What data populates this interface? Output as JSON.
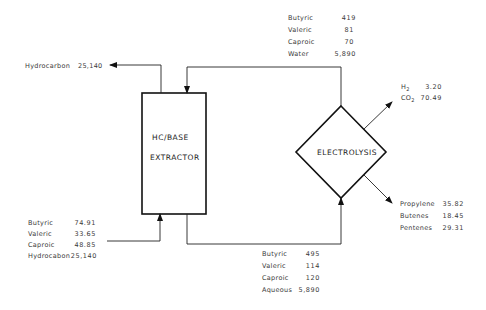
{
  "nodes": {
    "extractor": {
      "line1": "HC/BASE",
      "line2": "EXTRACTOR"
    },
    "electrolysis": {
      "label": "ELECTROLYSIS"
    }
  },
  "streams": {
    "hydrocarbon_out": {
      "label": "Hydrocarbon",
      "value": "25,140"
    },
    "recycle": [
      {
        "label": "Butyric",
        "value": "419"
      },
      {
        "label": "Valeric",
        "value": "81"
      },
      {
        "label": "Caproic",
        "value": "70"
      },
      {
        "label": "Water",
        "value": "5,890"
      }
    ],
    "gases": [
      {
        "label": "H",
        "sub": "2",
        "value": "3.20"
      },
      {
        "label": "CO",
        "sub": "2",
        "value": "70.49"
      }
    ],
    "olefins": [
      {
        "label": "Propylene",
        "value": "35.82"
      },
      {
        "label": "Butenes",
        "value": "18.45"
      },
      {
        "label": "Pentenes",
        "value": "29.31"
      }
    ],
    "feed": [
      {
        "label": "Butyric",
        "value": "74.91"
      },
      {
        "label": "Valeric",
        "value": "33.65"
      },
      {
        "label": "Caproic",
        "value": "48.85"
      },
      {
        "label": "Hydrocabon",
        "value": "25,140"
      }
    ],
    "aqueous": [
      {
        "label": "Butyric",
        "value": "495"
      },
      {
        "label": "Valeric",
        "value": "114"
      },
      {
        "label": "Caproic",
        "value": "120"
      },
      {
        "label": "Aqueous",
        "value": "5,890"
      }
    ]
  }
}
